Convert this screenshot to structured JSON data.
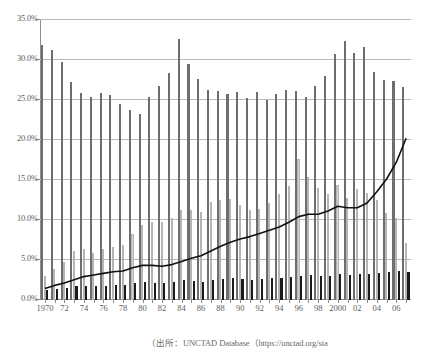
{
  "chart_data": {
    "type": "bar",
    "title": "",
    "subtitle": "",
    "xlabel": "",
    "ylabel": "",
    "ylim": [
      0,
      35
    ],
    "ytick_labels": [
      "0.0%",
      "5.0%",
      "10.0%",
      "15.0%",
      "20.0%",
      "25.0%",
      "30.0%",
      "35.0%"
    ],
    "ytick_values": [
      0,
      5,
      10,
      15,
      20,
      25,
      30,
      35
    ],
    "ytick_format": "percent",
    "grid": "horizontal",
    "legend": "none",
    "legend_position": "none",
    "categories": [
      "1970",
      "1971",
      "1972",
      "1973",
      "1974",
      "1975",
      "1976",
      "1977",
      "1978",
      "1979",
      "1980",
      "1981",
      "1982",
      "1983",
      "1984",
      "1985",
      "1986",
      "1987",
      "1988",
      "1989",
      "1990",
      "1991",
      "1992",
      "1993",
      "1994",
      "1995",
      "1996",
      "1997",
      "1998",
      "1999",
      "2000",
      "2001",
      "2002",
      "2003",
      "2004",
      "2005",
      "2006",
      "2007"
    ],
    "xtick_labels": [
      "1970",
      "",
      "72",
      "",
      "74",
      "",
      "76",
      "",
      "78",
      "",
      "80",
      "",
      "82",
      "",
      "84",
      "",
      "86",
      "",
      "88",
      "",
      "90",
      "",
      "92",
      "",
      "94",
      "",
      "96",
      "",
      "98",
      "",
      "2000",
      "",
      "02",
      "",
      "04",
      "",
      "06",
      ""
    ],
    "series": [
      {
        "name": "series-dark-gray",
        "color": "#6e6e6e",
        "type": "bar",
        "values": [
          31.9,
          31.3,
          29.7,
          27.2,
          25.9,
          25.4,
          25.9,
          25.6,
          24.5,
          23.7,
          23.2,
          25.4,
          26.7,
          28.4,
          32.6,
          29.5,
          27.6,
          26.3,
          26.1,
          25.8,
          26.0,
          25.3,
          26.0,
          25.0,
          25.8,
          26.2,
          26.1,
          25.4,
          26.7,
          28.0,
          30.8,
          32.4,
          30.9,
          31.6,
          28.5,
          27.5,
          27.4,
          26.6
        ]
      },
      {
        "name": "series-light-gray",
        "color": "#d4d4d4",
        "type": "bar",
        "values": [
          3.0,
          3.9,
          4.7,
          6.1,
          6.4,
          5.9,
          6.4,
          6.6,
          6.9,
          8.2,
          9.4,
          9.8,
          9.7,
          10.3,
          11.3,
          11.2,
          11.0,
          12.2,
          12.5,
          12.6,
          11.9,
          11.2,
          11.4,
          12.1,
          13.3,
          14.3,
          17.6,
          15.4,
          14.0,
          13.2,
          14.4,
          12.7,
          13.9,
          13.4,
          12.5,
          10.9,
          10.3,
          7.1
        ]
      },
      {
        "name": "series-black",
        "color": "#1b1b1b",
        "type": "bar",
        "values": [
          1.3,
          1.4,
          1.5,
          1.7,
          1.8,
          1.7,
          1.8,
          1.9,
          1.9,
          2.1,
          2.2,
          2.1,
          2.1,
          2.2,
          2.5,
          2.4,
          2.3,
          2.5,
          2.6,
          2.7,
          2.6,
          2.5,
          2.6,
          2.7,
          2.8,
          2.9,
          3.0,
          3.1,
          3.0,
          3.0,
          3.2,
          3.1,
          3.2,
          3.3,
          3.4,
          3.5,
          3.6,
          3.5
        ]
      },
      {
        "name": "series-line",
        "color": "#111111",
        "type": "line",
        "values": [
          1.3,
          1.7,
          2.0,
          2.4,
          2.8,
          3.0,
          3.2,
          3.4,
          3.5,
          3.9,
          4.2,
          4.2,
          4.1,
          4.3,
          4.7,
          5.1,
          5.4,
          6.0,
          6.6,
          7.1,
          7.5,
          7.8,
          8.2,
          8.6,
          9.0,
          9.6,
          10.3,
          10.6,
          10.6,
          11.0,
          11.6,
          11.4,
          11.4,
          12.0,
          13.4,
          15.0,
          17.1,
          20.1
        ]
      }
    ]
  },
  "caption": {
    "text": "（出所：UNCTAD Database（https://unctad.org/sta"
  }
}
